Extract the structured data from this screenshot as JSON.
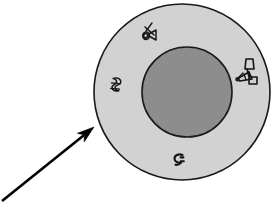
{
  "figure": {
    "title": "Schematic cross-section of a spherical body with annulus and core",
    "background_color": "#ffffff",
    "width": 276,
    "height": 202
  },
  "shapes": {
    "outer_circle": {
      "name": "outer-circle",
      "label": "Outer shell",
      "cx": 182,
      "cy": 92,
      "r": 88,
      "fill": "#d2d2d2",
      "stroke": "#1a1a1a",
      "stroke_width": 1.6
    },
    "inner_circle": {
      "name": "inner-circle",
      "label": "Inner core",
      "cx": 187,
      "cy": 92,
      "r": 45,
      "fill": "#8d8d8d",
      "stroke": "#1a1a1a",
      "stroke_width": 1.6
    }
  },
  "arrow": {
    "name": "pointer-arrow",
    "label": "Pointer arrow",
    "color": "#000000",
    "tail_x": 2,
    "tail_y": 201,
    "tip_x": 94,
    "tip_y": 127,
    "shaft_width": 2.6,
    "head_length": 17,
    "head_width": 11
  },
  "marks": [
    {
      "id": "mark-top",
      "name": "ink-mark-top",
      "label": "Ink mark (upper region)",
      "x": 148,
      "y": 35,
      "color": "#141414"
    },
    {
      "id": "mark-left",
      "name": "ink-mark-left",
      "label": "Ink mark (left region)",
      "x": 116,
      "y": 86,
      "color": "#141414"
    },
    {
      "id": "mark-right",
      "name": "ink-mark-right",
      "label": "Ink mark (right region)",
      "x": 248,
      "y": 75,
      "color": "#141414"
    },
    {
      "id": "mark-bottom",
      "name": "ink-mark-bottom",
      "label": "Ink mark (lower region)",
      "x": 179,
      "y": 160,
      "color": "#141414"
    }
  ]
}
